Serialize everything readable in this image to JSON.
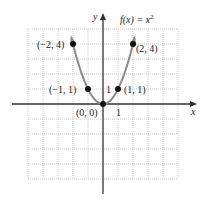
{
  "chart_data": {
    "type": "line",
    "function_label": {
      "prefix": "f(x) = x",
      "superscript": "2"
    },
    "xlabel": "x",
    "ylabel": "y",
    "xlim": [
      -5,
      5
    ],
    "ylim": [
      -5,
      5
    ],
    "grid": true,
    "grid_style": "dotted",
    "tick_labels": {
      "x_unit": "1",
      "y_unit": "1"
    },
    "series": [
      {
        "name": "f(x) = x^2",
        "x": [
          -2.1,
          -2,
          -1.5,
          -1,
          -0.5,
          0,
          0.5,
          1,
          1.5,
          2,
          2.1
        ],
        "y": [
          4.41,
          4,
          2.25,
          1,
          0.25,
          0,
          0.25,
          1,
          2.25,
          4,
          4.41
        ]
      }
    ],
    "points": [
      {
        "x": -2,
        "y": 4,
        "label": "(−2, 4)"
      },
      {
        "x": -1,
        "y": 1,
        "label": "(−1, 1)"
      },
      {
        "x": 0,
        "y": 0,
        "label": "(0, 0)"
      },
      {
        "x": 1,
        "y": 1,
        "label": "(1, 1)"
      },
      {
        "x": 2,
        "y": 4,
        "label": "(2, 4)"
      }
    ],
    "colors": {
      "curve": "#8a8a8a",
      "axis": "#333333",
      "grid": "#b5b5b5",
      "point": "#111111"
    }
  }
}
